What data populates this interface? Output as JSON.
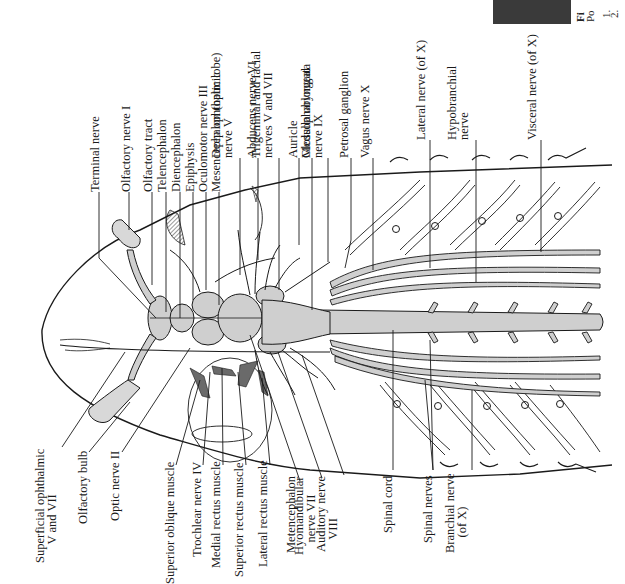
{
  "figure": {
    "colors": {
      "line": "#1a1a1a",
      "tissue_fill": "#cfcfcf",
      "background": "#ffffff"
    }
  },
  "labels_top": [
    {
      "id": "terminal-nerve",
      "text": "Terminal nerve",
      "x": 98,
      "y": 192
    },
    {
      "id": "olfactory-nerve-i",
      "text": "Olfactory nerve I",
      "x": 129,
      "y": 192
    },
    {
      "id": "olfactory-tract",
      "text": "Olfactory tract",
      "x": 151,
      "y": 192
    },
    {
      "id": "telencephalon",
      "text": "Telencephalon",
      "x": 165,
      "y": 192
    },
    {
      "id": "diencephalon",
      "text": "Diencephalon",
      "x": 179,
      "y": 192
    },
    {
      "id": "epiphysis",
      "text": "Epiphysis",
      "x": 193,
      "y": 192
    },
    {
      "id": "oculomotor-nerve-iii",
      "text": "Oculomotor nerve III",
      "x": 206,
      "y": 192
    },
    {
      "id": "mesencephalon",
      "text": "Mesencephalon (optic lobe)",
      "x": 219,
      "y": 192
    },
    {
      "id": "deep-ophthalmic",
      "text": "Deep ophthalmic\nnerve V",
      "x": 231,
      "y": 158
    },
    {
      "id": "abducens-nerve-vi",
      "text": "Abducens nerve VI",
      "x": 255,
      "y": 158
    },
    {
      "id": "trigeminal-facial",
      "text": "Trigeminal and facial\nnerves V and VII",
      "x": 271,
      "y": 158
    },
    {
      "id": "auricle",
      "text": "Auricle",
      "x": 296,
      "y": 158
    },
    {
      "id": "medulla-oblongata",
      "text": "Medulla oblongata",
      "x": 309,
      "y": 158
    },
    {
      "id": "glossopharyngeal",
      "text": "Glossopharyngeal\nnerve IX",
      "x": 321,
      "y": 158
    },
    {
      "id": "petrosal-ganglion",
      "text": "Petrosal ganglion",
      "x": 347,
      "y": 158
    },
    {
      "id": "vagus-nerve-x",
      "text": "Vagus nerve X",
      "x": 368,
      "y": 158
    },
    {
      "id": "lateral-nerve-x",
      "text": "Lateral nerve (of X)",
      "x": 424,
      "y": 140
    },
    {
      "id": "hypobranchial-nerve",
      "text": "Hypobranchial\nnerve",
      "x": 467,
      "y": 140
    },
    {
      "id": "visceral-nerve-x",
      "text": "Visceral nerve (of X)",
      "x": 535,
      "y": 140
    }
  ],
  "labels_bottom": [
    {
      "id": "superficial-ophthalmic",
      "text": "Superficial ophthalmic\n      V and VII",
      "x": 55,
      "y": 563
    },
    {
      "id": "olfactory-bulb",
      "text": "Olfactory bulb",
      "x": 86,
      "y": 524
    },
    {
      "id": "optic-nerve-ii",
      "text": "Optic nerve II",
      "x": 118,
      "y": 521
    },
    {
      "id": "superior-oblique-muscle",
      "text": "Superior oblique muscle",
      "x": 173,
      "y": 584
    },
    {
      "id": "trochlear-nerve-iv",
      "text": "Trochlear nerve IV",
      "x": 200,
      "y": 557
    },
    {
      "id": "medial-rectus-muscle",
      "text": "Medial rectus muscle",
      "x": 219,
      "y": 568
    },
    {
      "id": "superior-rectus-muscle",
      "text": "Superior rectus muscle",
      "x": 242,
      "y": 577
    },
    {
      "id": "lateral-rectus-muscle",
      "text": "Lateral rectus muscle",
      "x": 266,
      "y": 567
    },
    {
      "id": "metencephalon",
      "text": "Metencephalon",
      "x": 294,
      "y": 553
    },
    {
      "id": "hyomandibular-nerve-vii",
      "text": "Hyomandibular\n    nerve VII",
      "x": 314,
      "y": 555
    },
    {
      "id": "auditory-nerve-viii",
      "text": "Auditory nerve\n    VIII",
      "x": 336,
      "y": 552
    },
    {
      "id": "spinal-cord",
      "text": "Spinal cord",
      "x": 391,
      "y": 533
    },
    {
      "id": "spinal-nerves",
      "text": "Spinal nerves",
      "x": 431,
      "y": 543
    },
    {
      "id": "branchial-nerve-x",
      "text": "Branchial nerve\n     (of X)",
      "x": 465,
      "y": 553
    }
  ],
  "corner_fragment": {
    "line1": "Fi",
    "line2": "Po",
    "line3": "1.",
    "line4": "2."
  }
}
